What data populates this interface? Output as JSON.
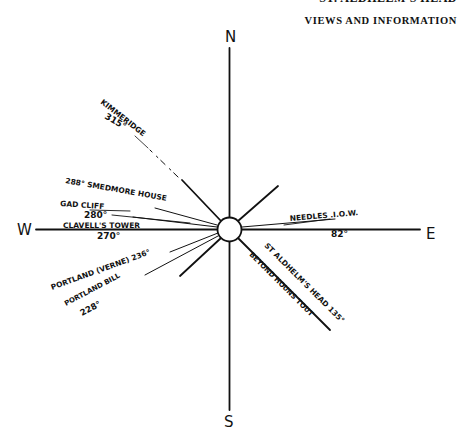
{
  "header": {
    "running_head_partial": "ST. ALDHELM'S HEAD",
    "section_title": "VIEWS AND INFORMATION"
  },
  "compass": {
    "cardinals": {
      "north": "N",
      "south": "S",
      "east": "E",
      "west": "W"
    },
    "bearings": [
      {
        "name": "KIMMERIDGE",
        "bearing": "315°"
      },
      {
        "name": "SMEDMORE HOUSE",
        "bearing": "288°"
      },
      {
        "name": "GAD CLIFF",
        "bearing": "280°"
      },
      {
        "name": "CLAVELL'S TOWER",
        "bearing": "270°"
      },
      {
        "name": "PORTLAND (VERNE)",
        "bearing": "236°"
      },
      {
        "name": "PORTLAND BILL",
        "bearing": "228°"
      },
      {
        "name": "ST ALDHELM'S HEAD",
        "bearing": "135°",
        "note": "BEYOND HOUNS TOUT"
      },
      {
        "name": "NEEDLES .I.O.W.",
        "bearing": "82°"
      }
    ]
  },
  "labels": {
    "kimmeridge_name": "KIMMERIDGE",
    "kimmeridge_deg": "315°",
    "smedmore": "288° SMEDMORE HOUSE",
    "gad_cliff_name": "GAD CLIFF",
    "gad_cliff_deg": "280°",
    "clavells_name": "CLAVELL'S TOWER",
    "clavells_deg": "270°",
    "portland_verne": "PORTLAND (VERNE) 236°",
    "portland_bill_name": "PORTLAND BILL",
    "portland_bill_deg": "228°",
    "st_aldhelms": "ST ALDHELM'S HEAD 135°",
    "beyond": "BEYOND HOUNS TOUT",
    "needles_name": "NEEDLES .I.O.W.",
    "needles_deg": "82°"
  }
}
